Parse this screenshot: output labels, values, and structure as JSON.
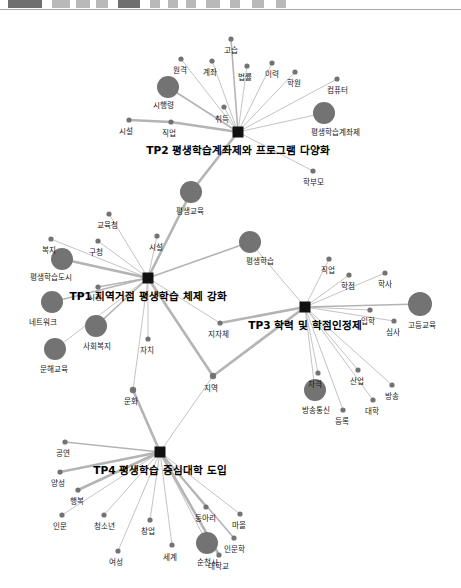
{
  "toolbar": {
    "blocks": [
      {
        "x": 8,
        "w": 34,
        "tone": "dark"
      },
      {
        "x": 52,
        "w": 18,
        "tone": "light"
      },
      {
        "x": 76,
        "w": 14,
        "tone": "light"
      },
      {
        "x": 96,
        "w": 12,
        "tone": "light"
      },
      {
        "x": 118,
        "w": 22,
        "tone": "dark"
      },
      {
        "x": 150,
        "w": 10,
        "tone": "light"
      },
      {
        "x": 168,
        "w": 10,
        "tone": "light"
      },
      {
        "x": 186,
        "w": 10,
        "tone": "light"
      },
      {
        "x": 206,
        "w": 14,
        "tone": "light"
      },
      {
        "x": 230,
        "w": 10,
        "tone": "light"
      },
      {
        "x": 252,
        "w": 12,
        "tone": "light"
      },
      {
        "x": 276,
        "w": 10,
        "tone": "light"
      }
    ]
  },
  "chart_data": {
    "type": "network-graph",
    "background": "#ffffff",
    "colors": {
      "node": "#737373",
      "hub": "#111111",
      "edge": "#b4b4b4",
      "label": "#1a1a1a"
    },
    "hubs": [
      {
        "id": "tp2",
        "label": "TP2 평생학습계좌제와 프로그램 다양화",
        "x": 238,
        "y": 122,
        "size": 11,
        "label_x": 238,
        "label_y": 141
      },
      {
        "id": "tp1",
        "label": "TP1 지역거점 평생학습 체제 강화",
        "x": 148,
        "y": 268,
        "size": 11,
        "label_x": 148,
        "label_y": 287
      },
      {
        "id": "tp3",
        "label": "TP3 학력 및 학점인정제",
        "x": 305,
        "y": 297,
        "size": 11,
        "label_x": 305,
        "label_y": 316
      },
      {
        "id": "tp4",
        "label": "TP4 평생학습 중심대학 도입",
        "x": 160,
        "y": 442,
        "size": 11,
        "label_x": 160,
        "label_y": 461
      }
    ],
    "nodes": [
      {
        "id": "gosup",
        "label": "고습",
        "x": 231,
        "y": 29,
        "r": 2.6,
        "label_x": 231,
        "label_y": 41
      },
      {
        "id": "wongyeok",
        "label": "원격",
        "x": 181,
        "y": 49,
        "r": 2.6,
        "label_x": 180,
        "label_y": 61
      },
      {
        "id": "gyejwa",
        "label": "계좌",
        "x": 212,
        "y": 51,
        "r": 2.6,
        "label_x": 210,
        "label_y": 63
      },
      {
        "id": "beopryul",
        "label": "법률",
        "x": 247,
        "y": 56,
        "r": 2.6,
        "label_x": 245,
        "label_y": 68
      },
      {
        "id": "iryeok",
        "label": "이력",
        "x": 272,
        "y": 53,
        "r": 2.6,
        "label_x": 272,
        "label_y": 65
      },
      {
        "id": "hagwon",
        "label": "학원",
        "x": 295,
        "y": 62,
        "r": 2.6,
        "label_x": 294,
        "label_y": 74
      },
      {
        "id": "computer",
        "label": "컴퓨터",
        "x": 337,
        "y": 69,
        "r": 2.6,
        "label_x": 337,
        "label_y": 81
      },
      {
        "id": "sihaengryeong",
        "label": "시행령",
        "x": 168,
        "y": 77,
        "r": 11,
        "label_x": 163,
        "label_y": 96
      },
      {
        "id": "chwideuk",
        "label": "취득",
        "x": 224,
        "y": 97,
        "r": 2.6,
        "label_x": 222,
        "label_y": 110
      },
      {
        "id": "pyeongsaeng_gyejwa",
        "label": "평생학습계좌제",
        "x": 324,
        "y": 103,
        "r": 11,
        "label_x": 335,
        "label_y": 123
      },
      {
        "id": "sisul2",
        "label": "시설",
        "x": 129,
        "y": 110,
        "r": 2.6,
        "label_x": 126,
        "label_y": 122
      },
      {
        "id": "jikeop2",
        "label": "직업",
        "x": 171,
        "y": 112,
        "r": 2.6,
        "label_x": 169,
        "label_y": 124
      },
      {
        "id": "hakbumo",
        "label": "학부모",
        "x": 313,
        "y": 161,
        "r": 2.6,
        "label_x": 313,
        "label_y": 173
      },
      {
        "id": "pyeongsaenggyoyuk",
        "label": "평생교육",
        "x": 191,
        "y": 182,
        "r": 11,
        "label_x": 190,
        "label_y": 202
      },
      {
        "id": "gyoyukcheong",
        "label": "교육청",
        "x": 109,
        "y": 204,
        "r": 2.6,
        "label_x": 107,
        "label_y": 216
      },
      {
        "id": "gucheong",
        "label": "구청",
        "x": 98,
        "y": 231,
        "r": 2.6,
        "label_x": 96,
        "label_y": 243
      },
      {
        "id": "sisul1",
        "label": "시설",
        "x": 157,
        "y": 226,
        "r": 2.6,
        "label_x": 156,
        "label_y": 238
      },
      {
        "id": "bokji",
        "label": "복지",
        "x": 51,
        "y": 229,
        "r": 2.6,
        "label_x": 49,
        "label_y": 241
      },
      {
        "id": "pyeongsaenghaksup",
        "label": "평생학습",
        "x": 250,
        "y": 232,
        "r": 11,
        "label_x": 260,
        "label_y": 252
      },
      {
        "id": "haksupdosi",
        "label": "평생학습도시",
        "x": 62,
        "y": 249,
        "r": 11,
        "label_x": 51,
        "label_y": 268
      },
      {
        "id": "sicheong",
        "label": "시청",
        "x": 98,
        "y": 277,
        "r": 2.6,
        "label_x": 95,
        "label_y": 288
      },
      {
        "id": "jikeop3",
        "label": "직업",
        "x": 329,
        "y": 249,
        "r": 2.6,
        "label_x": 328,
        "label_y": 261
      },
      {
        "id": "hakjeom",
        "label": "학점",
        "x": 349,
        "y": 265,
        "r": 2.6,
        "label_x": 348,
        "label_y": 277
      },
      {
        "id": "haksa",
        "label": "학사",
        "x": 385,
        "y": 263,
        "r": 2.6,
        "label_x": 385,
        "label_y": 275
      },
      {
        "id": "network",
        "label": "네트워크",
        "x": 52,
        "y": 292,
        "r": 11,
        "label_x": 43,
        "label_y": 313
      },
      {
        "id": "godeunggyoyuk",
        "label": "고등교육",
        "x": 420,
        "y": 294,
        "r": 12,
        "label_x": 422,
        "label_y": 316
      },
      {
        "id": "ipak",
        "label": "입학",
        "x": 370,
        "y": 300,
        "r": 2.6,
        "label_x": 368,
        "label_y": 312
      },
      {
        "id": "simsa",
        "label": "심사",
        "x": 394,
        "y": 311,
        "r": 2.6,
        "label_x": 393,
        "label_y": 323
      },
      {
        "id": "sahoebokji",
        "label": "사회복지",
        "x": 96,
        "y": 316,
        "r": 11,
        "label_x": 97,
        "label_y": 337
      },
      {
        "id": "jijache",
        "label": "지자체",
        "x": 220,
        "y": 313,
        "r": 2.6,
        "label_x": 218,
        "label_y": 325
      },
      {
        "id": "munhaegyoyuk",
        "label": "문해교육",
        "x": 55,
        "y": 339,
        "r": 11,
        "label_x": 54,
        "label_y": 360
      },
      {
        "id": "jachi",
        "label": "자치",
        "x": 148,
        "y": 329,
        "r": 2.6,
        "label_x": 147,
        "label_y": 341
      },
      {
        "id": "jageok",
        "label": "자격",
        "x": 318,
        "y": 363,
        "r": 2.6,
        "label_x": 315,
        "label_y": 375
      },
      {
        "id": "saneop",
        "label": "산업",
        "x": 358,
        "y": 360,
        "r": 2.6,
        "label_x": 357,
        "label_y": 372
      },
      {
        "id": "bangsong",
        "label": "방송",
        "x": 392,
        "y": 375,
        "r": 2.6,
        "label_x": 392,
        "label_y": 387
      },
      {
        "id": "jiyeok",
        "label": "지역",
        "x": 213,
        "y": 366,
        "r": 3.2,
        "label_x": 211,
        "label_y": 379
      },
      {
        "id": "munhwa",
        "label": "문화",
        "x": 133,
        "y": 380,
        "r": 3.2,
        "label_x": 131,
        "label_y": 392
      },
      {
        "id": "bangsongtongsin",
        "label": "방송통신",
        "x": 315,
        "y": 380,
        "r": 11,
        "label_x": 316,
        "label_y": 401
      },
      {
        "id": "daehak",
        "label": "대학",
        "x": 373,
        "y": 390,
        "r": 2.6,
        "label_x": 372,
        "label_y": 402
      },
      {
        "id": "deungrok",
        "label": "등록",
        "x": 343,
        "y": 400,
        "r": 2.6,
        "label_x": 342,
        "label_y": 412
      },
      {
        "id": "gongyeon",
        "label": "공연",
        "x": 65,
        "y": 432,
        "r": 2.6,
        "label_x": 63,
        "label_y": 444
      },
      {
        "id": "yangseong",
        "label": "양성",
        "x": 60,
        "y": 462,
        "r": 2.6,
        "label_x": 58,
        "label_y": 474
      },
      {
        "id": "haengbok",
        "label": "행복",
        "x": 78,
        "y": 480,
        "r": 2.6,
        "label_x": 77,
        "label_y": 492
      },
      {
        "id": "inmun",
        "label": "인문",
        "x": 62,
        "y": 505,
        "r": 2.6,
        "label_x": 60,
        "label_y": 517
      },
      {
        "id": "cheongsonyeon",
        "label": "청소년",
        "x": 104,
        "y": 505,
        "r": 2.6,
        "label_x": 104,
        "label_y": 517
      },
      {
        "id": "changeop",
        "label": "창업",
        "x": 150,
        "y": 510,
        "r": 2.6,
        "label_x": 148,
        "label_y": 522
      },
      {
        "id": "dongari",
        "label": "동아리",
        "x": 206,
        "y": 497,
        "r": 2.6,
        "label_x": 205,
        "label_y": 509
      },
      {
        "id": "maeul",
        "label": "마을",
        "x": 240,
        "y": 504,
        "r": 2.6,
        "label_x": 239,
        "label_y": 516
      },
      {
        "id": "inmunhak",
        "label": "인문학",
        "x": 234,
        "y": 528,
        "r": 2.6,
        "label_x": 234,
        "label_y": 540
      },
      {
        "id": "yeoseong",
        "label": "여성",
        "x": 118,
        "y": 541,
        "r": 2.6,
        "label_x": 116,
        "label_y": 553
      },
      {
        "id": "segye",
        "label": "세계",
        "x": 172,
        "y": 535,
        "r": 2.6,
        "label_x": 170,
        "label_y": 548
      },
      {
        "id": "suncheonsi",
        "label": "순천시",
        "x": 207,
        "y": 533,
        "r": 11,
        "label_x": 207,
        "label_y": 553
      },
      {
        "id": "daehakgyo",
        "label": "대학교",
        "x": 219,
        "y": 545,
        "r": 2.6,
        "label_x": 218,
        "label_y": 557
      }
    ],
    "edges": [
      {
        "from": "tp2",
        "to": "gosup",
        "weight": 2
      },
      {
        "from": "tp2",
        "to": "wongyeok",
        "weight": 1
      },
      {
        "from": "tp2",
        "to": "gyejwa",
        "weight": 1
      },
      {
        "from": "tp2",
        "to": "beopryul",
        "weight": 1
      },
      {
        "from": "tp2",
        "to": "iryeok",
        "weight": 1
      },
      {
        "from": "tp2",
        "to": "hagwon",
        "weight": 1
      },
      {
        "from": "tp2",
        "to": "computer",
        "weight": 1
      },
      {
        "from": "tp2",
        "to": "sihaengryeong",
        "weight": 2
      },
      {
        "from": "tp2",
        "to": "chwideuk",
        "weight": 1
      },
      {
        "from": "tp2",
        "to": "pyeongsaeng_gyejwa",
        "weight": 1
      },
      {
        "from": "tp2",
        "to": "jikeop2",
        "weight": 3
      },
      {
        "from": "jikeop2",
        "to": "sisul2",
        "weight": 3
      },
      {
        "from": "tp2",
        "to": "hakbumo",
        "weight": 1
      },
      {
        "from": "tp2",
        "to": "pyeongsaenggyoyuk",
        "weight": 3
      },
      {
        "from": "tp2",
        "to": "chwideuk2",
        "weight": 1
      },
      {
        "from": "tp1",
        "to": "pyeongsaenggyoyuk",
        "weight": 3
      },
      {
        "from": "tp1",
        "to": "gyoyukcheong",
        "weight": 1
      },
      {
        "from": "tp1",
        "to": "gucheong",
        "weight": 1
      },
      {
        "from": "tp1",
        "to": "sisul1",
        "weight": 1
      },
      {
        "from": "tp1",
        "to": "bokji",
        "weight": 1
      },
      {
        "from": "tp1",
        "to": "pyeongsaenghaksup",
        "weight": 2
      },
      {
        "from": "tp1",
        "to": "haksupdosi",
        "weight": 3
      },
      {
        "from": "tp1",
        "to": "sicheong",
        "weight": 2
      },
      {
        "from": "tp1",
        "to": "network",
        "weight": 2
      },
      {
        "from": "tp1",
        "to": "sahoebokji",
        "weight": 2
      },
      {
        "from": "tp1",
        "to": "munhaegyoyuk",
        "weight": 1
      },
      {
        "from": "tp1",
        "to": "jachi",
        "weight": 1
      },
      {
        "from": "tp1",
        "to": "jijache",
        "weight": 1
      },
      {
        "from": "tp1",
        "to": "jiyeok",
        "weight": 3
      },
      {
        "from": "tp1",
        "to": "munhwa",
        "weight": 1
      },
      {
        "from": "munhwa",
        "to": "tp4",
        "weight": 3
      },
      {
        "from": "jiyeok",
        "to": "tp3",
        "weight": 3
      },
      {
        "from": "jiyeok",
        "to": "tp4",
        "weight": 1
      },
      {
        "from": "tp3",
        "to": "jijache",
        "weight": 3
      },
      {
        "from": "tp3",
        "to": "pyeongsaenghaksup",
        "weight": 1
      },
      {
        "from": "tp3",
        "to": "jikeop3",
        "weight": 1
      },
      {
        "from": "tp3",
        "to": "hakjeom",
        "weight": 1
      },
      {
        "from": "tp3",
        "to": "haksa",
        "weight": 1
      },
      {
        "from": "tp3",
        "to": "godeunggyoyuk",
        "weight": 2
      },
      {
        "from": "tp3",
        "to": "ipak",
        "weight": 1
      },
      {
        "from": "tp3",
        "to": "simsa",
        "weight": 1
      },
      {
        "from": "tp3",
        "to": "jageok",
        "weight": 1
      },
      {
        "from": "tp3",
        "to": "saneop",
        "weight": 1
      },
      {
        "from": "tp3",
        "to": "bangsong",
        "weight": 1
      },
      {
        "from": "tp3",
        "to": "bangsongtongsin",
        "weight": 1
      },
      {
        "from": "tp3",
        "to": "daehak",
        "weight": 1
      },
      {
        "from": "tp3",
        "to": "deungrok",
        "weight": 1
      },
      {
        "from": "tp4",
        "to": "gongyeon",
        "weight": 2
      },
      {
        "from": "tp4",
        "to": "yangseong",
        "weight": 3
      },
      {
        "from": "tp4",
        "to": "haengbok",
        "weight": 3
      },
      {
        "from": "tp4",
        "to": "inmun",
        "weight": 1
      },
      {
        "from": "tp4",
        "to": "cheongsonyeon",
        "weight": 1
      },
      {
        "from": "tp4",
        "to": "changeop",
        "weight": 1
      },
      {
        "from": "tp4",
        "to": "dongari",
        "weight": 2
      },
      {
        "from": "tp4",
        "to": "maeul",
        "weight": 1
      },
      {
        "from": "tp4",
        "to": "inmunhak",
        "weight": 2
      },
      {
        "from": "tp4",
        "to": "yeoseong",
        "weight": 1
      },
      {
        "from": "tp4",
        "to": "segye",
        "weight": 1
      },
      {
        "from": "tp4",
        "to": "suncheonsi",
        "weight": 1
      },
      {
        "from": "tp4",
        "to": "daehakgyo",
        "weight": 3
      }
    ]
  }
}
